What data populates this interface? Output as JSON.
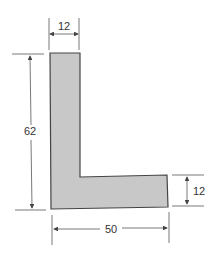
{
  "diagram": {
    "shape": "L-shaped cross-section",
    "fill_color": "#c8c8c8",
    "stroke_color": "#444444",
    "dimensions": {
      "top_width": "12",
      "height": "62",
      "right_thickness": "12",
      "bottom_width": "50"
    }
  }
}
